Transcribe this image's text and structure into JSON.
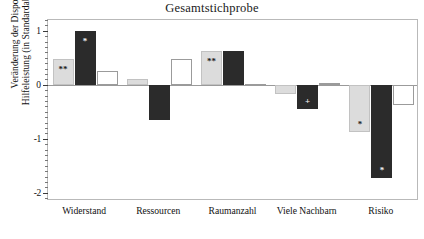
{
  "chart_data": {
    "type": "bar",
    "title": "Gesamtstichprobe",
    "xlabel": "",
    "ylabel": "Veränderung der Disposition zur\nHilfeleistung (in Standardabweichungen)",
    "categories": [
      "Widerstand",
      "Ressourcen",
      "Raumanzahl",
      "Viele Nachbarn",
      "Risiko"
    ],
    "ylim": [
      -2.15,
      1.2
    ],
    "yticks": [
      1,
      0,
      -1,
      -2
    ],
    "ytick_labels": [
      "1",
      "0",
      "-1",
      "-2"
    ],
    "minor_ticks": true,
    "grid": false,
    "legend": "none",
    "series": [
      {
        "name": "series-1-light-gray",
        "color": "#dcdcdc",
        "values": [
          0.47,
          0.1,
          0.62,
          -0.17,
          -0.87
        ],
        "annotations": [
          "**",
          "",
          "**",
          "",
          "*"
        ]
      },
      {
        "name": "series-2-dark",
        "color": "#2b2b2b",
        "values": [
          1.0,
          -0.65,
          0.62,
          -0.45,
          -1.72
        ],
        "annotations": [
          "*",
          "",
          "",
          "+",
          "*"
        ]
      },
      {
        "name": "series-3-white",
        "color": "#ffffff",
        "values": [
          0.25,
          0.47,
          0.01,
          0.03,
          -0.37
        ],
        "annotations": [
          "",
          "",
          "",
          "",
          ""
        ]
      }
    ]
  }
}
